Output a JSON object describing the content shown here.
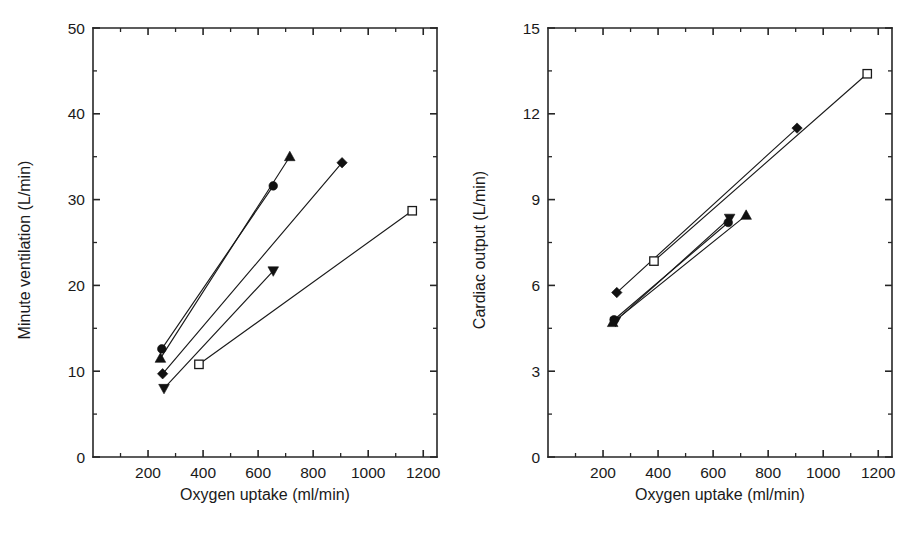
{
  "figure": {
    "background_color": "#ffffff",
    "line_color": "#1a1a1a",
    "marker_fill_color": "#111111",
    "marker_open_fill_color": "#ffffff",
    "panel_count": 2
  },
  "chart_data": [
    {
      "type": "line",
      "panel": "left",
      "title": "",
      "xlabel": "Oxygen uptake (ml/min)",
      "ylabel": "Minute ventilation (L/min)",
      "xlim": [
        0,
        1250
      ],
      "ylim": [
        0,
        50
      ],
      "xticks": [
        200,
        400,
        600,
        800,
        1000,
        1200
      ],
      "xtick_labels": [
        "200",
        "400",
        "600",
        "800",
        "1000",
        "1200"
      ],
      "yticks": [
        0,
        10,
        20,
        30,
        40,
        50
      ],
      "ytick_labels": [
        "0",
        "10",
        "20",
        "30",
        "40",
        "50"
      ],
      "x_minor_step": 100,
      "y_minor_step": 5,
      "grid": false,
      "legend": "none",
      "series": [
        {
          "name": "filled-circle",
          "marker": "circle-filled",
          "x": [
            250,
            655
          ],
          "y": [
            12.6,
            31.6
          ]
        },
        {
          "name": "filled-triangle-up",
          "marker": "triangle-up-filled",
          "x": [
            245,
            715
          ],
          "y": [
            11.5,
            35.0
          ]
        },
        {
          "name": "filled-diamond",
          "marker": "diamond-filled",
          "x": [
            253,
            905
          ],
          "y": [
            9.7,
            34.3
          ]
        },
        {
          "name": "filled-triangle-down",
          "marker": "triangle-down-filled",
          "x": [
            258,
            655
          ],
          "y": [
            8.0,
            21.7
          ]
        },
        {
          "name": "open-square",
          "marker": "square-open",
          "x": [
            385,
            1160
          ],
          "y": [
            10.8,
            28.7
          ]
        }
      ]
    },
    {
      "type": "line",
      "panel": "right",
      "title": "",
      "xlabel": "Oxygen uptake (ml/min)",
      "ylabel": "Cardiac output (L/min)",
      "xlim": [
        0,
        1250
      ],
      "ylim": [
        0,
        15
      ],
      "xticks": [
        200,
        400,
        600,
        800,
        1000,
        1200
      ],
      "xtick_labels": [
        "200",
        "400",
        "600",
        "800",
        "1000",
        "1200"
      ],
      "yticks": [
        0,
        3,
        6,
        9,
        12,
        15
      ],
      "ytick_labels": [
        "0",
        "3",
        "6",
        "9",
        "12",
        "15"
      ],
      "x_minor_step": 100,
      "y_minor_step": 1.5,
      "grid": false,
      "legend": "none",
      "series": [
        {
          "name": "filled-diamond",
          "marker": "diamond-filled",
          "x": [
            250,
            905
          ],
          "y": [
            5.75,
            11.5
          ]
        },
        {
          "name": "open-square",
          "marker": "square-open",
          "x": [
            385,
            1160
          ],
          "y": [
            6.85,
            13.4
          ]
        },
        {
          "name": "filled-circle",
          "marker": "circle-filled",
          "x": [
            240,
            655
          ],
          "y": [
            4.8,
            8.2
          ]
        },
        {
          "name": "filled-triangle-down",
          "marker": "triangle-down-filled",
          "x": [
            245,
            660
          ],
          "y": [
            4.75,
            8.35
          ]
        },
        {
          "name": "filled-triangle-up",
          "marker": "triangle-up-filled",
          "x": [
            235,
            720
          ],
          "y": [
            4.7,
            8.45
          ]
        }
      ]
    }
  ]
}
